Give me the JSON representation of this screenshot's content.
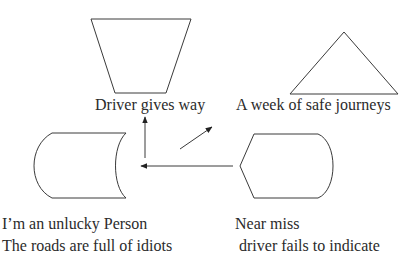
{
  "diagram": {
    "nodes": [
      {
        "id": "driver-gives-way",
        "shape": "trapezoid",
        "label": "Driver gives way"
      },
      {
        "id": "safe-journeys",
        "shape": "triangle",
        "label": "A week of safe journeys"
      },
      {
        "id": "unlucky-person",
        "shape": "stored-data",
        "label_lines": [
          "I’m an unlucky Person",
          "The roads are full of idiots"
        ]
      },
      {
        "id": "near-miss",
        "shape": "display",
        "label_lines": [
          "Near miss",
          " driver fails to indicate"
        ]
      }
    ],
    "edges": [
      {
        "from": "near-miss",
        "to": "unlucky-person-junction",
        "direction": "left"
      },
      {
        "from": "junction",
        "to": "driver-gives-way",
        "direction": "up"
      },
      {
        "from": "junction",
        "to": "safe-journeys",
        "direction": "up-right"
      }
    ],
    "colors": {
      "stroke": "#3a3a3a",
      "text": "#2b2b2b",
      "background": "#ffffff"
    }
  }
}
